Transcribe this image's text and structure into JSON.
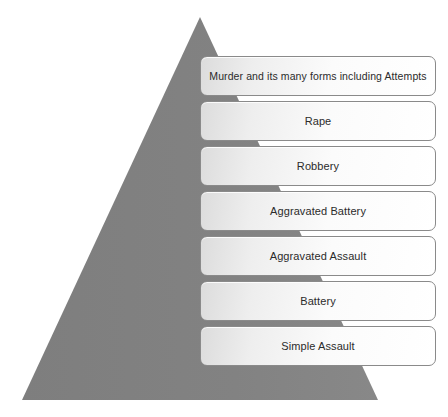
{
  "diagram": {
    "type": "pyramid",
    "title": "",
    "shape": {
      "name": "pyramid-triangle",
      "fill_color": "#808080",
      "apex": {
        "x": 200,
        "y": 17
      },
      "base_left": {
        "x": 22,
        "y": 400
      },
      "base_right": {
        "x": 378,
        "y": 400
      }
    },
    "background_color": "#ffffff",
    "tier_border_color": "#8a8a8a",
    "tier_text_color": "#2b2b2b",
    "tiers": [
      {
        "rank": 1,
        "label": "Murder and its many forms including Attempts"
      },
      {
        "rank": 2,
        "label": "Rape"
      },
      {
        "rank": 3,
        "label": "Robbery"
      },
      {
        "rank": 4,
        "label": "Aggravated Battery"
      },
      {
        "rank": 5,
        "label": "Aggravated Assault"
      },
      {
        "rank": 6,
        "label": "Battery"
      },
      {
        "rank": 7,
        "label": "Simple Assault"
      }
    ]
  }
}
